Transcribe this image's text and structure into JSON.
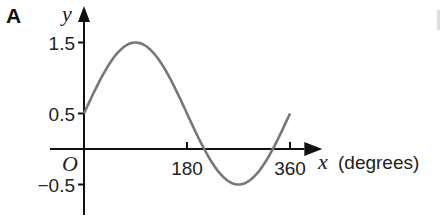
{
  "figure_label": "A",
  "chart_data": {
    "type": "line",
    "title": "",
    "xlabel": "x (degrees)",
    "ylabel": "y",
    "origin_label": "O",
    "x_ticks": [
      180,
      360
    ],
    "x_tick_labels": [
      "180",
      "360"
    ],
    "y_ticks": [
      1.5,
      0.5,
      -0.5
    ],
    "y_tick_labels": [
      "1.5",
      "0.5",
      "−0.5"
    ],
    "xlim": [
      -10,
      400
    ],
    "ylim": [
      -0.85,
      1.85
    ],
    "grid": false,
    "legend": null,
    "series": [
      {
        "name": "y = sin x + 0.5",
        "color": "#777777",
        "x": [
          0,
          30,
          60,
          90,
          120,
          150,
          180,
          210,
          240,
          270,
          300,
          330,
          360
        ],
        "y": [
          0.5,
          1.0,
          1.366,
          1.5,
          1.366,
          1.0,
          0.5,
          0.0,
          -0.366,
          -0.5,
          -0.366,
          0.0,
          0.5
        ]
      }
    ]
  }
}
